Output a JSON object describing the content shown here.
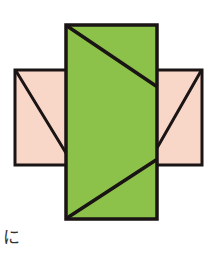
{
  "figure": {
    "label": "に",
    "colors": {
      "green_fill": "#8cc24a",
      "pink_fill": "#f8d6c8",
      "stroke": "#1a1414"
    },
    "shapes": {
      "left_rect": {
        "x": 15,
        "y": 70,
        "w": 52,
        "h": 95
      },
      "right_rect": {
        "x": 156,
        "y": 70,
        "w": 46,
        "h": 95
      },
      "center_rect": {
        "x": 66,
        "y": 25,
        "w": 91,
        "h": 194
      },
      "lines": [
        {
          "name": "left-diagonal",
          "x1": 16,
          "y1": 71,
          "x2": 66,
          "y2": 153
        },
        {
          "name": "right-diagonal",
          "x1": 201,
          "y1": 71,
          "x2": 157,
          "y2": 148
        },
        {
          "name": "center-top-diagonal",
          "x1": 67,
          "y1": 26,
          "x2": 156,
          "y2": 86
        },
        {
          "name": "center-bottom-diagonal",
          "x1": 156,
          "y1": 160,
          "x2": 67,
          "y2": 218
        }
      ]
    }
  }
}
